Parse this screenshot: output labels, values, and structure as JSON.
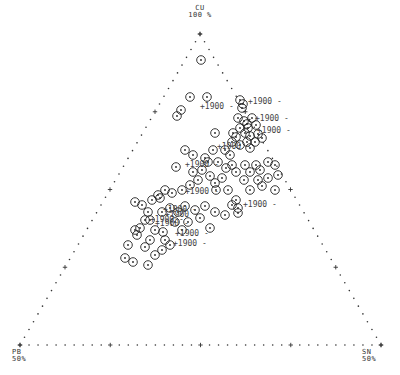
{
  "chart_data": {
    "type": "scatter",
    "subtype": "ternary",
    "title": "",
    "vertices": {
      "top": {
        "name": "CU",
        "value": "100 %"
      },
      "left": {
        "name": "PB",
        "value": "50%"
      },
      "right": {
        "name": "SN",
        "value": "50%"
      }
    },
    "colors": {
      "axis": "#333333",
      "marker": "#222222",
      "label": "#444444",
      "background": "#ffffff"
    },
    "marker": "circle-with-center-dot",
    "point_annotation": "1900",
    "points_px": [
      [
        201,
        60
      ],
      [
        190,
        97
      ],
      [
        207,
        97
      ],
      [
        181,
        110
      ],
      [
        177,
        116
      ],
      [
        240,
        100
      ],
      [
        243,
        104
      ],
      [
        242,
        108
      ],
      [
        215,
        133
      ],
      [
        238,
        118
      ],
      [
        244,
        121
      ],
      [
        247,
        124
      ],
      [
        240,
        128
      ],
      [
        248,
        128
      ],
      [
        252,
        118
      ],
      [
        256,
        125
      ],
      [
        233,
        133
      ],
      [
        236,
        137
      ],
      [
        245,
        133
      ],
      [
        250,
        136
      ],
      [
        232,
        142
      ],
      [
        240,
        145
      ],
      [
        247,
        142
      ],
      [
        250,
        148
      ],
      [
        255,
        142
      ],
      [
        258,
        134
      ],
      [
        262,
        138
      ],
      [
        185,
        150
      ],
      [
        193,
        155
      ],
      [
        205,
        158
      ],
      [
        213,
        150
      ],
      [
        225,
        150
      ],
      [
        230,
        155
      ],
      [
        218,
        162
      ],
      [
        226,
        168
      ],
      [
        208,
        162
      ],
      [
        202,
        170
      ],
      [
        176,
        167
      ],
      [
        193,
        172
      ],
      [
        198,
        180
      ],
      [
        210,
        176
      ],
      [
        215,
        183
      ],
      [
        222,
        178
      ],
      [
        232,
        165
      ],
      [
        236,
        172
      ],
      [
        245,
        165
      ],
      [
        250,
        172
      ],
      [
        256,
        165
      ],
      [
        260,
        170
      ],
      [
        268,
        162
      ],
      [
        275,
        165
      ],
      [
        278,
        175
      ],
      [
        268,
        178
      ],
      [
        258,
        180
      ],
      [
        262,
        186
      ],
      [
        275,
        190
      ],
      [
        250,
        190
      ],
      [
        244,
        180
      ],
      [
        228,
        190
      ],
      [
        216,
        190
      ],
      [
        236,
        200
      ],
      [
        190,
        185
      ],
      [
        182,
        190
      ],
      [
        172,
        193
      ],
      [
        165,
        190
      ],
      [
        158,
        195
      ],
      [
        152,
        200
      ],
      [
        142,
        205
      ],
      [
        135,
        202
      ],
      [
        148,
        212
      ],
      [
        162,
        212
      ],
      [
        170,
        208
      ],
      [
        178,
        212
      ],
      [
        185,
        206
      ],
      [
        195,
        210
      ],
      [
        205,
        206
      ],
      [
        215,
        212
      ],
      [
        225,
        215
      ],
      [
        188,
        222
      ],
      [
        200,
        218
      ],
      [
        210,
        228
      ],
      [
        182,
        230
      ],
      [
        160,
        198
      ],
      [
        145,
        220
      ],
      [
        140,
        228
      ],
      [
        137,
        235
      ],
      [
        150,
        220
      ],
      [
        155,
        230
      ],
      [
        175,
        222
      ],
      [
        163,
        232
      ],
      [
        165,
        240
      ],
      [
        170,
        245
      ],
      [
        150,
        240
      ],
      [
        145,
        247
      ],
      [
        135,
        230
      ],
      [
        128,
        245
      ],
      [
        125,
        258
      ],
      [
        133,
        262
      ],
      [
        148,
        265
      ],
      [
        155,
        255
      ],
      [
        162,
        250
      ],
      [
        238,
        208
      ],
      [
        232,
        205
      ],
      [
        238,
        213
      ]
    ],
    "labeled_points_px": [
      [
        195,
        106
      ],
      [
        243,
        101
      ],
      [
        250,
        118
      ],
      [
        252,
        130
      ],
      [
        212,
        146
      ],
      [
        180,
        164
      ],
      [
        180,
        191
      ],
      [
        158,
        209
      ],
      [
        160,
        214
      ],
      [
        145,
        219
      ],
      [
        150,
        223
      ],
      [
        170,
        233
      ],
      [
        168,
        243
      ],
      [
        238,
        204
      ]
    ],
    "axis": {
      "left_edge_ticks": 20,
      "bottom_edge_ticks": 20,
      "right_edge_ticks": 20,
      "major_tick_every": 5
    },
    "legend": null,
    "grid": false
  }
}
